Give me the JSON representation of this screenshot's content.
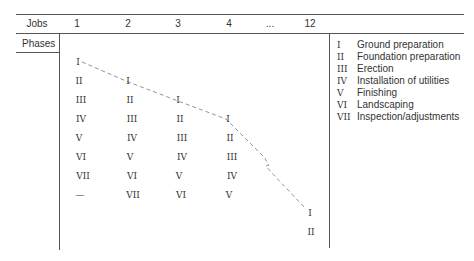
{
  "header": {
    "jobs_label": "Jobs",
    "phases_label": "Phases",
    "columns": [
      "1",
      "2",
      "3",
      "4",
      "...",
      "12"
    ]
  },
  "grid": {
    "col1": [
      "I",
      "II",
      "III",
      "IV",
      "V",
      "VI",
      "VII",
      "—"
    ],
    "col2": [
      "I",
      "II",
      "III",
      "IV",
      "V",
      "VI",
      "VII"
    ],
    "col3": [
      "I",
      "II",
      "III",
      "IV",
      "V",
      "VI"
    ],
    "col4": [
      "I",
      "II",
      "III",
      "IV",
      "V"
    ],
    "col12": [
      "I",
      "II"
    ]
  },
  "legend": [
    {
      "num": "I",
      "label": "Ground preparation"
    },
    {
      "num": "II",
      "label": "Foundation preparation"
    },
    {
      "num": "III",
      "label": "Erection"
    },
    {
      "num": "IV",
      "label": "Installation of utilities"
    },
    {
      "num": "V",
      "label": "Finishing"
    },
    {
      "num": "VI",
      "label": "Landscaping"
    },
    {
      "num": "VII",
      "label": "Inspection/adjustments"
    }
  ]
}
